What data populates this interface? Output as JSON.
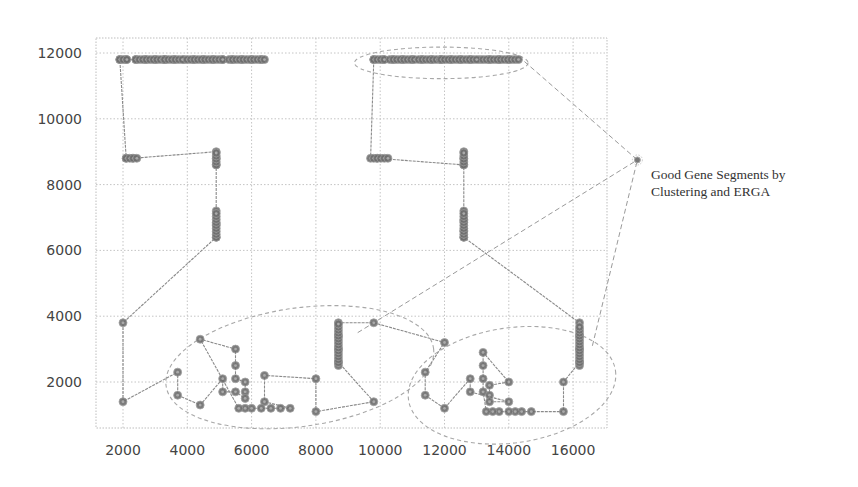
{
  "chart_data": {
    "type": "line",
    "title": "",
    "xlabel": "",
    "ylabel": "",
    "xlim": [
      880,
      17400
    ],
    "ylim": [
      600,
      12400
    ],
    "grid": true,
    "grid_style": "dotted",
    "x_ticks": [
      2000,
      4000,
      6000,
      8000,
      10000,
      12000,
      14000,
      16000
    ],
    "y_ticks": [
      2000,
      4000,
      6000,
      8000,
      10000,
      12000
    ],
    "x_tick_labels": [
      "2000",
      "4000",
      "6000",
      "8000",
      "10000",
      "12000",
      "14000",
      "16000"
    ],
    "y_tick_labels": [
      "2000",
      "4000",
      "6000",
      "8000",
      "10000",
      "12000"
    ],
    "marker": "circle",
    "marker_color": "#6e6e6e",
    "line_color": "#8a8a8a",
    "path": [
      [
        14000,
        11800
      ],
      [
        13700,
        11800
      ],
      [
        13400,
        11800
      ],
      [
        13100,
        11800
      ],
      [
        12800,
        11800
      ],
      [
        12500,
        11800
      ],
      [
        12200,
        11800
      ],
      [
        11900,
        11800
      ],
      [
        11600,
        11800
      ],
      [
        11300,
        11800
      ],
      [
        11000,
        11800
      ],
      [
        10700,
        11800
      ],
      [
        10400,
        11800
      ],
      [
        10100,
        11800
      ],
      [
        9800,
        11800
      ],
      [
        9700,
        8800
      ],
      [
        9900,
        8800
      ],
      [
        12600,
        8600
      ],
      [
        12600,
        8800
      ],
      [
        12600,
        9000
      ],
      [
        12600,
        7200
      ],
      [
        12600,
        6900
      ],
      [
        12600,
        6600
      ],
      [
        12600,
        6400
      ],
      [
        16200,
        3800
      ],
      [
        16200,
        3400
      ],
      [
        16200,
        3000
      ],
      [
        16200,
        2600
      ],
      [
        15700,
        2000
      ],
      [
        15700,
        1100
      ],
      [
        14700,
        1100
      ],
      [
        14400,
        1100
      ],
      [
        14200,
        1100
      ],
      [
        14000,
        1100
      ],
      [
        13700,
        1100
      ],
      [
        13500,
        1100
      ],
      [
        13300,
        1100
      ],
      [
        13200,
        1700
      ],
      [
        13200,
        2100
      ],
      [
        13200,
        2500
      ],
      [
        13200,
        2900
      ],
      [
        14000,
        2000
      ],
      [
        13400,
        1900
      ],
      [
        13400,
        1600
      ],
      [
        13400,
        1400
      ],
      [
        14000,
        1400
      ],
      [
        12800,
        1700
      ],
      [
        12800,
        2100
      ],
      [
        12000,
        1200
      ],
      [
        11400,
        1600
      ],
      [
        11400,
        2300
      ],
      [
        12000,
        3200
      ],
      [
        9800,
        3800
      ],
      [
        8700,
        3800
      ],
      [
        8700,
        3400
      ],
      [
        8700,
        3000
      ],
      [
        8700,
        2600
      ],
      [
        9800,
        1400
      ],
      [
        8000,
        1100
      ],
      [
        8000,
        2100
      ],
      [
        6400,
        2200
      ],
      [
        6400,
        1400
      ],
      [
        7200,
        1200
      ],
      [
        6900,
        1200
      ],
      [
        6600,
        1200
      ],
      [
        6300,
        1200
      ],
      [
        6000,
        1200
      ],
      [
        5800,
        1200
      ],
      [
        5600,
        1200
      ],
      [
        4400,
        3300
      ],
      [
        5500,
        3000
      ],
      [
        5500,
        2500
      ],
      [
        5500,
        2100
      ],
      [
        5800,
        2000
      ],
      [
        5800,
        1700
      ],
      [
        5800,
        1500
      ],
      [
        5500,
        1700
      ],
      [
        5100,
        1700
      ],
      [
        5100,
        2100
      ],
      [
        4400,
        1300
      ],
      [
        3700,
        1600
      ],
      [
        3700,
        2300
      ],
      [
        2000,
        1400
      ],
      [
        2000,
        3800
      ],
      [
        4900,
        6400
      ],
      [
        4900,
        6800
      ],
      [
        4900,
        7200
      ],
      [
        4900,
        8600
      ],
      [
        4900,
        8800
      ],
      [
        4900,
        9000
      ],
      [
        2300,
        8800
      ],
      [
        2100,
        8800
      ],
      [
        1900,
        11800
      ],
      [
        2100,
        11800
      ],
      [
        2400,
        11800
      ],
      [
        2700,
        11800
      ],
      [
        3000,
        11800
      ],
      [
        3300,
        11800
      ],
      [
        3600,
        11800
      ],
      [
        3900,
        11800
      ],
      [
        4200,
        11800
      ],
      [
        4500,
        11800
      ],
      [
        4800,
        11800
      ],
      [
        5100,
        11800
      ],
      [
        5400,
        11800
      ],
      [
        5700,
        11800
      ],
      [
        6000,
        11800
      ],
      [
        6300,
        11800
      ]
    ],
    "clusters": [
      {
        "name": "top-left-row",
        "y": 11800,
        "x_from": 1900,
        "x_to": 6300,
        "segments": [
          [
            1900,
            2200
          ],
          [
            2400,
            3300
          ],
          [
            3300,
            3900
          ],
          [
            4000,
            5100
          ],
          [
            5300,
            6400
          ]
        ]
      },
      {
        "name": "top-right-row",
        "y": 11800,
        "x_from": 9800,
        "x_to": 14000,
        "segments": [
          [
            9800,
            10200
          ],
          [
            10300,
            11100
          ],
          [
            11200,
            11900
          ],
          [
            11900,
            13000
          ],
          [
            13200,
            14300
          ]
        ]
      },
      {
        "name": "left-short-row",
        "y": 8800,
        "x_from": 2100,
        "x_to": 2500
      },
      {
        "name": "right-short-row",
        "y": 8800,
        "x_from": 9800,
        "x_to": 10300
      },
      {
        "name": "col-a",
        "x": 4900,
        "y_from": 8600,
        "y_to": 9000
      },
      {
        "name": "col-b",
        "x": 4900,
        "y_from": 6400,
        "y_to": 7200
      },
      {
        "name": "col-c",
        "x": 12600,
        "y_from": 8600,
        "y_to": 9000
      },
      {
        "name": "col-d",
        "x": 12600,
        "y_from": 6400,
        "y_to": 7200
      },
      {
        "name": "col-e",
        "x": 8700,
        "y_from": 2500,
        "y_to": 3800
      },
      {
        "name": "col-f",
        "x": 16200,
        "y_from": 2500,
        "y_to": 3700
      }
    ],
    "annotations": [
      {
        "type": "ellipse",
        "cx": 11900,
        "cy": 11700,
        "rx": 2700,
        "ry": 480,
        "angle": 0,
        "style": "dashed"
      },
      {
        "type": "ellipse",
        "cx": 7500,
        "cy": 2450,
        "rx": 4200,
        "ry": 1800,
        "angle": -8,
        "style": "dashed"
      },
      {
        "type": "ellipse",
        "cx": 14100,
        "cy": 1900,
        "rx": 3250,
        "ry": 1750,
        "angle": -8,
        "style": "dashed"
      },
      {
        "type": "dashed-line",
        "from": [
          14300,
          11900
        ],
        "to": [
          18000,
          8750
        ]
      },
      {
        "type": "dashed-line",
        "from": [
          9300,
          3500
        ],
        "to": [
          18000,
          8750
        ]
      },
      {
        "type": "dashed-line",
        "from": [
          16600,
          3100
        ],
        "to": [
          18000,
          8750
        ]
      }
    ],
    "annotation_label": {
      "line1": "Good Gene Segments by",
      "line2": "Clustering and ERGA"
    }
  }
}
